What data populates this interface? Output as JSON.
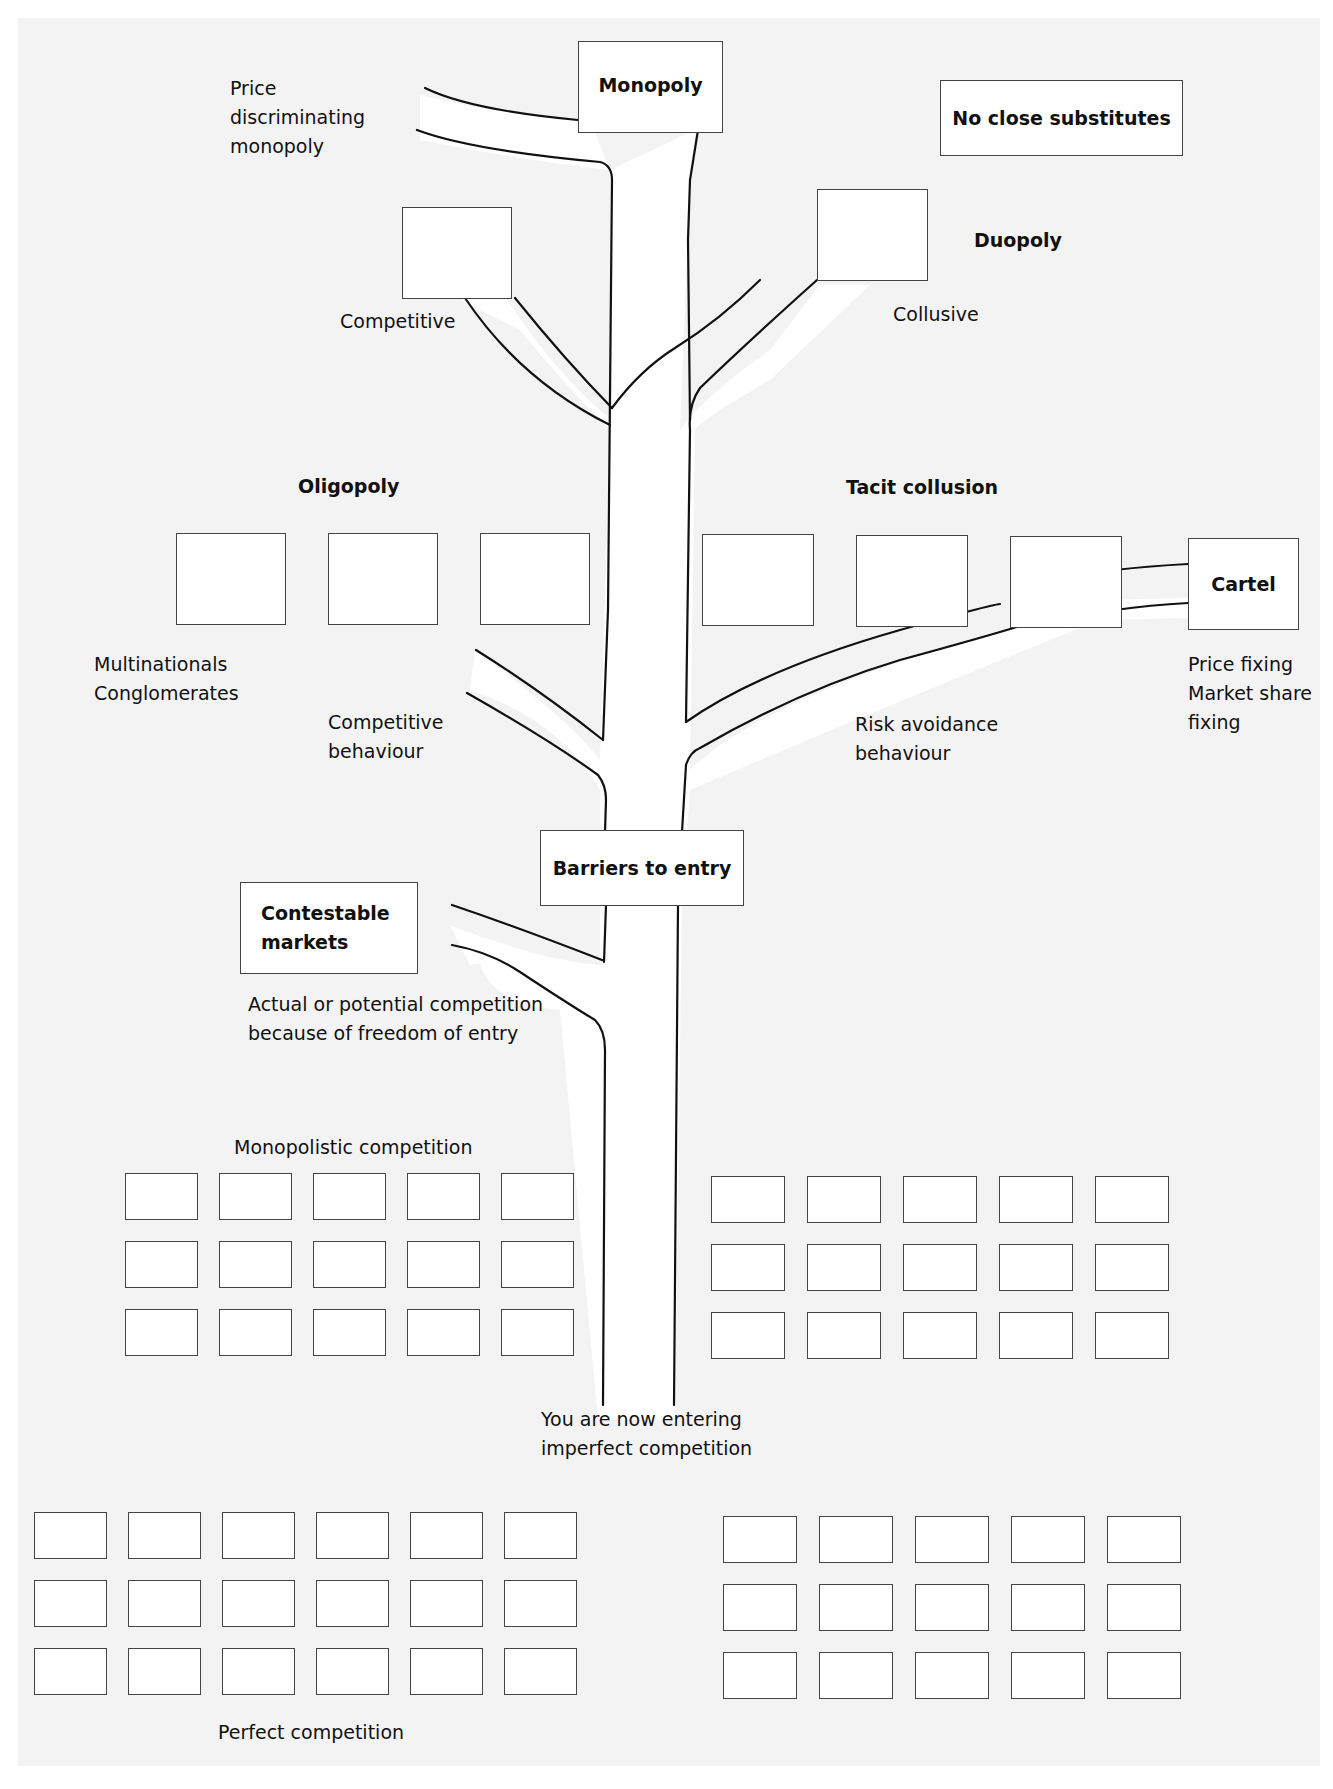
{
  "diagram": {
    "nodes": {
      "monopoly": "Monopoly",
      "no_close_substitutes": "No close substitutes",
      "duopoly": "Duopoly",
      "oligopoly": "Oligopoly",
      "tacit_collusion": "Tacit collusion",
      "cartel": "Cartel",
      "barriers_to_entry": "Barriers to entry",
      "contestable_markets": "Contestable\nmarkets"
    },
    "labels": {
      "price_discriminating_monopoly": "Price\ndiscriminating\nmonopoly",
      "competitive": "Competitive",
      "collusive": "Collusive",
      "multinationals_conglomerates": "Multinationals\nConglomerates",
      "competitive_behaviour": "Competitive\nbehaviour",
      "risk_avoidance_behaviour": "Risk avoidance\nbehaviour",
      "cartel_notes": "Price fixing\nMarket share\nfixing",
      "contestable_note": "Actual or potential competition\nbecause of freedom of entry",
      "monopolistic_competition": "Monopolistic competition",
      "entering_imperfect": "You are now entering\nimperfect competition",
      "perfect_competition": "Perfect competition"
    },
    "box_grids": {
      "monopolistic_left": {
        "rows": 3,
        "cols": 5
      },
      "monopolistic_right": {
        "rows": 3,
        "cols": 5
      },
      "perfect_left": {
        "rows": 3,
        "cols": 6
      },
      "perfect_right": {
        "rows": 3,
        "cols": 5
      }
    },
    "colors": {
      "background": "#f3f3f3",
      "box_fill": "#ffffff",
      "stroke": "#111111"
    }
  }
}
